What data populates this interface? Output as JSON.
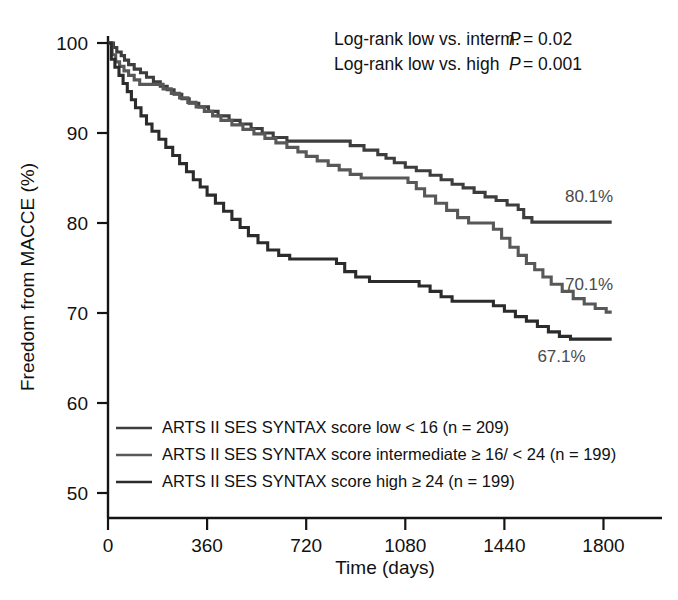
{
  "chart_data": {
    "type": "line",
    "title": "",
    "xlabel": "Time (days)",
    "ylabel": "Freedom from MACCE (%)",
    "xlim": [
      0,
      1860
    ],
    "ylim": [
      50,
      100
    ],
    "xticks": [
      0,
      360,
      720,
      1080,
      1440,
      1800
    ],
    "xtick_labels": [
      "0",
      "360",
      "720",
      "1080",
      "1440",
      "1800"
    ],
    "yticks": [
      50,
      60,
      70,
      80,
      90,
      100
    ],
    "ytick_labels": [
      "50",
      "60",
      "70",
      "80",
      "90",
      "100"
    ],
    "grid": false,
    "legend_position": "lower-left-inside",
    "annotations": [
      {
        "name": "logrank-low-vs-interm",
        "label": "Log-rank low vs. interm.",
        "stat": "P",
        "relation": "=",
        "value": "0.02"
      },
      {
        "name": "logrank-low-vs-high",
        "label": "Log-rank low vs. high",
        "stat": "P",
        "relation": "=",
        "value": "0.001"
      }
    ],
    "endpoint_labels": [
      {
        "series": "low",
        "text": "80.1%",
        "x": 1660,
        "y": 82.3
      },
      {
        "series": "intermediate",
        "text": "70.1%",
        "x": 1660,
        "y": 72.6
      },
      {
        "series": "high",
        "text": "67.1%",
        "x": 1560,
        "y": 64.6
      }
    ],
    "series": [
      {
        "name": "ARTS II SES SYNTAX score low < 16 (n = 209)",
        "short_name": "low",
        "n": 209,
        "color": "#3d3d3d",
        "final_value": 80.1,
        "points": [
          [
            0,
            100
          ],
          [
            20,
            99.5
          ],
          [
            32,
            99.0
          ],
          [
            48,
            98.6
          ],
          [
            60,
            98.1
          ],
          [
            75,
            97.6
          ],
          [
            95,
            97.1
          ],
          [
            118,
            96.7
          ],
          [
            140,
            96.2
          ],
          [
            165,
            95.7
          ],
          [
            190,
            95.2
          ],
          [
            215,
            94.8
          ],
          [
            240,
            94.3
          ],
          [
            268,
            93.8
          ],
          [
            295,
            93.3
          ],
          [
            330,
            92.9
          ],
          [
            365,
            92.4
          ],
          [
            400,
            91.9
          ],
          [
            440,
            91.4
          ],
          [
            480,
            91.0
          ],
          [
            520,
            90.5
          ],
          [
            560,
            90.0
          ],
          [
            600,
            89.5
          ],
          [
            650,
            89.1
          ],
          [
            700,
            89.1
          ],
          [
            760,
            89.1
          ],
          [
            820,
            89.1
          ],
          [
            880,
            88.6
          ],
          [
            930,
            88.1
          ],
          [
            980,
            87.6
          ],
          [
            1010,
            87.2
          ],
          [
            1040,
            86.7
          ],
          [
            1080,
            86.2
          ],
          [
            1120,
            85.8
          ],
          [
            1170,
            85.3
          ],
          [
            1210,
            84.8
          ],
          [
            1250,
            84.3
          ],
          [
            1290,
            83.9
          ],
          [
            1330,
            83.4
          ],
          [
            1370,
            82.9
          ],
          [
            1410,
            82.5
          ],
          [
            1450,
            82.0
          ],
          [
            1490,
            81.5
          ],
          [
            1510,
            80.6
          ],
          [
            1540,
            80.1
          ],
          [
            1600,
            80.1
          ],
          [
            1700,
            80.1
          ],
          [
            1790,
            80.1
          ],
          [
            1830,
            80.1
          ]
        ]
      },
      {
        "name": "ARTS II SES SYNTAX score intermediate ≥ 16/ < 24 (n = 199)",
        "short_name": "intermediate",
        "n": 199,
        "color": "#585858",
        "final_value": 70.1,
        "points": [
          [
            0,
            100
          ],
          [
            15,
            98.7
          ],
          [
            28,
            97.9
          ],
          [
            42,
            97.4
          ],
          [
            58,
            96.9
          ],
          [
            75,
            96.4
          ],
          [
            95,
            95.9
          ],
          [
            115,
            95.4
          ],
          [
            140,
            95.4
          ],
          [
            170,
            95.4
          ],
          [
            200,
            94.9
          ],
          [
            230,
            94.4
          ],
          [
            260,
            93.9
          ],
          [
            290,
            93.4
          ],
          [
            320,
            92.9
          ],
          [
            350,
            92.4
          ],
          [
            380,
            91.9
          ],
          [
            410,
            91.4
          ],
          [
            450,
            90.9
          ],
          [
            490,
            90.4
          ],
          [
            530,
            89.9
          ],
          [
            570,
            89.4
          ],
          [
            610,
            88.9
          ],
          [
            650,
            88.4
          ],
          [
            690,
            87.9
          ],
          [
            720,
            87.4
          ],
          [
            760,
            86.9
          ],
          [
            800,
            86.4
          ],
          [
            840,
            85.9
          ],
          [
            880,
            85.4
          ],
          [
            920,
            85.0
          ],
          [
            980,
            85.0
          ],
          [
            1040,
            85.0
          ],
          [
            1090,
            84.5
          ],
          [
            1120,
            83.8
          ],
          [
            1150,
            83.0
          ],
          [
            1190,
            82.2
          ],
          [
            1230,
            81.4
          ],
          [
            1270,
            80.6
          ],
          [
            1310,
            80.0
          ],
          [
            1360,
            80.0
          ],
          [
            1400,
            79.3
          ],
          [
            1430,
            78.3
          ],
          [
            1460,
            77.3
          ],
          [
            1490,
            76.4
          ],
          [
            1520,
            75.5
          ],
          [
            1550,
            74.8
          ],
          [
            1580,
            74.0
          ],
          [
            1610,
            73.2
          ],
          [
            1650,
            72.4
          ],
          [
            1690,
            71.6
          ],
          [
            1730,
            71.0
          ],
          [
            1770,
            70.5
          ],
          [
            1810,
            70.1
          ],
          [
            1830,
            70.1
          ]
        ]
      },
      {
        "name": "ARTS II SES SYNTAX score high ≥ 24 (n = 199)",
        "short_name": "high",
        "n": 199,
        "color": "#2b2b2b",
        "final_value": 67.1,
        "points": [
          [
            0,
            100
          ],
          [
            12,
            98.2
          ],
          [
            25,
            97.3
          ],
          [
            40,
            96.4
          ],
          [
            55,
            95.5
          ],
          [
            70,
            94.6
          ],
          [
            85,
            93.7
          ],
          [
            100,
            92.8
          ],
          [
            120,
            91.9
          ],
          [
            140,
            91.0
          ],
          [
            160,
            90.2
          ],
          [
            185,
            89.3
          ],
          [
            210,
            88.4
          ],
          [
            235,
            87.5
          ],
          [
            260,
            86.6
          ],
          [
            285,
            85.7
          ],
          [
            310,
            84.8
          ],
          [
            335,
            84.0
          ],
          [
            360,
            83.1
          ],
          [
            390,
            82.2
          ],
          [
            420,
            81.3
          ],
          [
            450,
            80.4
          ],
          [
            480,
            79.5
          ],
          [
            510,
            78.6
          ],
          [
            545,
            77.8
          ],
          [
            580,
            77.0
          ],
          [
            620,
            76.4
          ],
          [
            660,
            76.0
          ],
          [
            720,
            76.0
          ],
          [
            780,
            76.0
          ],
          [
            830,
            75.5
          ],
          [
            860,
            74.6
          ],
          [
            900,
            74.0
          ],
          [
            950,
            73.5
          ],
          [
            1010,
            73.5
          ],
          [
            1080,
            73.5
          ],
          [
            1130,
            73.0
          ],
          [
            1170,
            72.4
          ],
          [
            1210,
            71.8
          ],
          [
            1250,
            71.3
          ],
          [
            1300,
            71.3
          ],
          [
            1360,
            71.3
          ],
          [
            1400,
            70.8
          ],
          [
            1440,
            70.2
          ],
          [
            1480,
            69.6
          ],
          [
            1520,
            69.1
          ],
          [
            1560,
            68.5
          ],
          [
            1600,
            67.9
          ],
          [
            1640,
            67.4
          ],
          [
            1680,
            67.1
          ],
          [
            1750,
            67.1
          ],
          [
            1830,
            67.1
          ]
        ]
      }
    ]
  },
  "legend": {
    "items": [
      {
        "label": "ARTS II SES SYNTAX score low < 16 (n = 209)",
        "color": "#3d3d3d",
        "key": "legend-item-low"
      },
      {
        "label": "ARTS II SES SYNTAX score intermediate ≥ 16/ < 24 (n = 199)",
        "color": "#585858",
        "key": "legend-item-intermediate"
      },
      {
        "label": "ARTS II SES SYNTAX score high ≥ 24 (n = 199)",
        "color": "#2b2b2b",
        "key": "legend-item-high"
      }
    ]
  },
  "colors": {
    "axis": "#141414",
    "text": "#111111",
    "endpoint_label": "#4a4a4a",
    "background": "#ffffff"
  }
}
